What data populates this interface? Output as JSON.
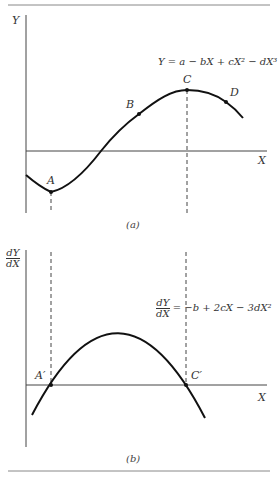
{
  "panel_a": {
    "y_axis_label": "Y",
    "x_axis_label": "X",
    "equation": "Y = a − bX + cX² − dX³",
    "points": {
      "A": "A",
      "B": "B",
      "C": "C",
      "D": "D"
    },
    "caption": "(a)"
  },
  "panel_b": {
    "y_axis_label_num": "dY",
    "y_axis_label_den": "dX",
    "x_axis_label": "X",
    "equation_num": "dY",
    "equation_den": "dX",
    "equation_rhs": "= −b + 2cX − 3dX²",
    "points": {
      "A_prime": "A′",
      "C_prime": "C′"
    },
    "caption": "(b)"
  },
  "colors": {
    "line": "#111111",
    "axis": "#444444",
    "rule": "#888888"
  }
}
